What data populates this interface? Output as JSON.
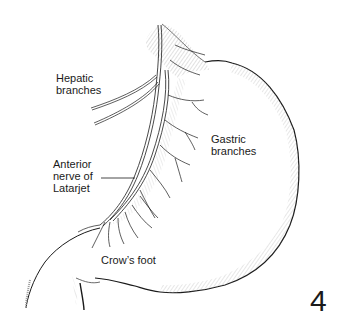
{
  "figure": {
    "number": "4",
    "labels": {
      "hepatic": "Hepatic\nbranches",
      "gastric": "Gastric\nbranches",
      "latarjet": "Anterior\nnerve of\nLatarjet",
      "crows_foot": "Crow’s foot"
    },
    "colors": {
      "ink": "#1a1a1a",
      "hatch": "#9a9a9a",
      "background": "#ffffff"
    }
  }
}
